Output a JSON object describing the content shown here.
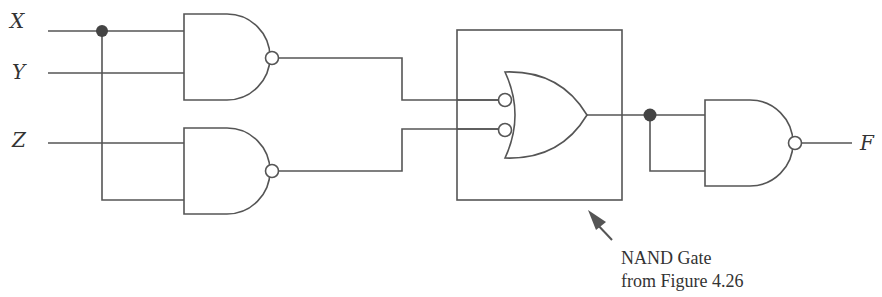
{
  "diagram": {
    "inputs": [
      {
        "name": "X",
        "label": "X"
      },
      {
        "name": "Y",
        "label": "Y"
      },
      {
        "name": "Z",
        "label": "Z"
      }
    ],
    "output": {
      "name": "F",
      "label": "F"
    },
    "gates": [
      {
        "id": "nand1",
        "type": "NAND",
        "inputs": [
          "X",
          "Y"
        ]
      },
      {
        "id": "nand2",
        "type": "NAND",
        "inputs": [
          "Z",
          "X"
        ]
      },
      {
        "id": "or_neg",
        "type": "OR with inverted inputs (NAND equivalent)",
        "inputs": [
          "nand1",
          "nand2"
        ]
      },
      {
        "id": "nand3",
        "type": "NAND",
        "inputs": [
          "or_neg",
          "or_neg"
        ]
      }
    ],
    "annotation": {
      "line1": "NAND Gate",
      "line2": "from Figure 4.26"
    }
  }
}
